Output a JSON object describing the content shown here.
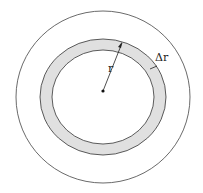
{
  "diagram": {
    "labels": {
      "radius": "r",
      "thickness": "Δr"
    },
    "colors": {
      "annulus_fill": "#e0e0e0",
      "stroke": "#333333"
    }
  }
}
